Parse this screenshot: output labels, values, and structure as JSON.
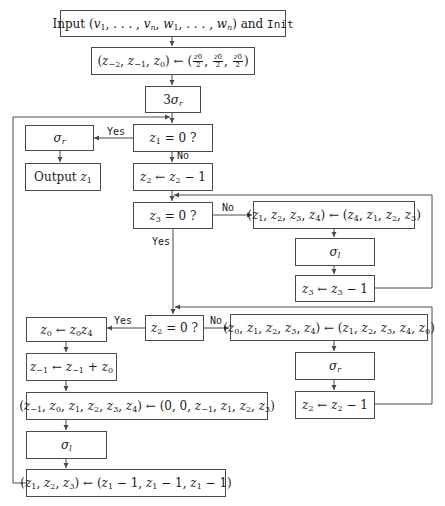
{
  "diagram": {
    "type": "flowchart",
    "colors": {
      "line": "#4a4a4a",
      "text": "#1a1a1a",
      "background": "#ffffff"
    },
    "nodes": [
      {
        "id": "input",
        "text": "Input (v1, . . . , vn, w1, . . . , wn) and Init"
      },
      {
        "id": "init-assign",
        "text": "(z−2, z−1, z0) ← (z0/2, z0/2, z0/2)"
      },
      {
        "id": "three-sigma-r",
        "text": "3σr"
      },
      {
        "id": "test-z1",
        "text": "z1 = 0 ?"
      },
      {
        "id": "sigma-r-final",
        "text": "σr"
      },
      {
        "id": "output",
        "text": "Output z1"
      },
      {
        "id": "dec-z2",
        "text": "z2 ← z2 − 1"
      },
      {
        "id": "test-z3",
        "text": "z3 = 0 ?"
      },
      {
        "id": "perm-4",
        "text": "(z1, z2, z3, z4) ← (z4, z1, z2, z3)"
      },
      {
        "id": "sigma-l-right",
        "text": "σl"
      },
      {
        "id": "dec-z3",
        "text": "z3 ← z3 − 1"
      },
      {
        "id": "test-z2",
        "text": "z2 = 0 ?"
      },
      {
        "id": "perm-5",
        "text": "(z0, z1, z2, z3, z4) ← (z1, z2, z3, z4, z0)"
      },
      {
        "id": "sigma-r-right",
        "text": "σr"
      },
      {
        "id": "dec-z2-right",
        "text": "z2 ← z2 − 1"
      },
      {
        "id": "mul-z0",
        "text": "z0 ← z0z4"
      },
      {
        "id": "add-zm1",
        "text": "z−1 ← z−1 + z0"
      },
      {
        "id": "shift-6",
        "text": "(z−1, z0, z1, z2, z3, z4) ← (0, 0, z−1, z1, z2, z3)"
      },
      {
        "id": "sigma-l-left",
        "text": "σl"
      },
      {
        "id": "reset-123",
        "text": "(z1, z2, z3) ← (z1 − 1, z1 − 1, z1 − 1)"
      }
    ],
    "edges": [
      {
        "from": "input",
        "to": "init-assign"
      },
      {
        "from": "init-assign",
        "to": "three-sigma-r"
      },
      {
        "from": "three-sigma-r",
        "to": "test-z1"
      },
      {
        "from": "test-z1",
        "to": "sigma-r-final",
        "label": "Yes"
      },
      {
        "from": "sigma-r-final",
        "to": "output"
      },
      {
        "from": "test-z1",
        "to": "dec-z2",
        "label": "No"
      },
      {
        "from": "dec-z2",
        "to": "test-z3"
      },
      {
        "from": "test-z3",
        "to": "perm-4",
        "label": "No"
      },
      {
        "from": "perm-4",
        "to": "sigma-l-right"
      },
      {
        "from": "sigma-l-right",
        "to": "dec-z3"
      },
      {
        "from": "dec-z3",
        "to": "test-z3"
      },
      {
        "from": "test-z3",
        "to": "test-z2",
        "label": "Yes"
      },
      {
        "from": "test-z2",
        "to": "perm-5",
        "label": "No"
      },
      {
        "from": "perm-5",
        "to": "sigma-r-right"
      },
      {
        "from": "sigma-r-right",
        "to": "dec-z2-right"
      },
      {
        "from": "dec-z2-right",
        "to": "test-z2"
      },
      {
        "from": "test-z2",
        "to": "mul-z0",
        "label": "Yes"
      },
      {
        "from": "mul-z0",
        "to": "add-zm1"
      },
      {
        "from": "add-zm1",
        "to": "shift-6"
      },
      {
        "from": "shift-6",
        "to": "sigma-l-left"
      },
      {
        "from": "sigma-l-left",
        "to": "reset-123"
      },
      {
        "from": "reset-123",
        "to": "test-z1"
      }
    ],
    "labels": {
      "yes": "Yes",
      "no": "No"
    }
  }
}
